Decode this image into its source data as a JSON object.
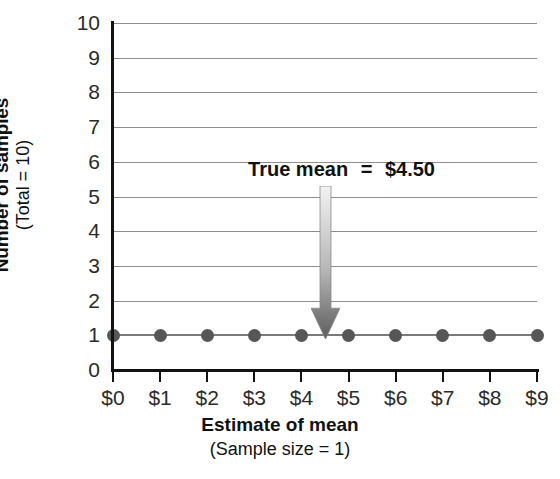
{
  "chart_data": {
    "type": "scatter",
    "title": "",
    "xlabel": "Estimate of mean",
    "xlabel_sub": "(Sample size = 1)",
    "ylabel": "Number of samples",
    "ylabel_sub": "(Total = 10)",
    "categories": [
      "$0",
      "$1",
      "$2",
      "$3",
      "$4",
      "$5",
      "$6",
      "$7",
      "$8",
      "$9"
    ],
    "x": [
      0,
      1,
      2,
      3,
      4,
      5,
      6,
      7,
      8,
      9
    ],
    "values": [
      1,
      1,
      1,
      1,
      1,
      1,
      1,
      1,
      1,
      1
    ],
    "series": [
      {
        "name": "Number of samples",
        "values": [
          1,
          1,
          1,
          1,
          1,
          1,
          1,
          1,
          1,
          1
        ]
      }
    ],
    "ytick_labels": [
      "10",
      "9",
      "8",
      "7",
      "6",
      "5",
      "4",
      "3",
      "2",
      "1",
      "0"
    ],
    "ytick_values": [
      10,
      9,
      8,
      7,
      6,
      5,
      4,
      3,
      2,
      1,
      0
    ],
    "xlim": [
      0,
      9
    ],
    "ylim": [
      0,
      10
    ],
    "grid": true,
    "grid_axis": "y",
    "legend": false,
    "legend_position": "none",
    "annotations": [
      {
        "label_prefix": "True mean",
        "label_equals": "=",
        "label_value": "$4.50",
        "text": "True mean  =  $4.50",
        "x_value": 4.5,
        "y_from": 5.3,
        "y_to": 1.0,
        "marker": "down-arrow"
      }
    ],
    "colors": {
      "marker": "#565656",
      "series_line": "#7a7a7a",
      "gridline": "#8d8d8d",
      "axis": "#121212",
      "arrow_top": "#f2f2f2",
      "arrow_bottom": "#5c5c5c",
      "text": "#1a1a1a",
      "background": "#ffffff"
    }
  }
}
